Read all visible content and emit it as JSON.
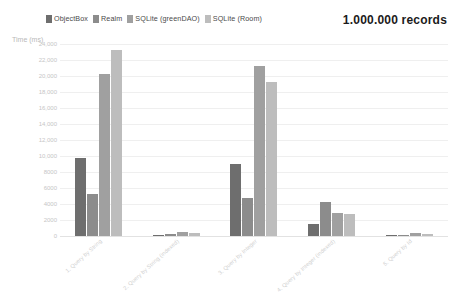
{
  "title": "1.000.000 records",
  "axis_title": "Time (ms)",
  "legend": [
    {
      "label": "ObjectBox",
      "color": "#6e6e6e"
    },
    {
      "label": "Realm",
      "color": "#8c8c8c"
    },
    {
      "label": "SQLite (greenDAO)",
      "color": "#a0a0a0"
    },
    {
      "label": "SQLite (Room)",
      "color": "#bdbdbd"
    }
  ],
  "chart_data": {
    "type": "bar",
    "title": "1.000.000 records",
    "xlabel": "",
    "ylabel": "Time (ms)",
    "ylim": [
      0,
      24000
    ],
    "ytick_values": [
      24000,
      22000,
      20000,
      18000,
      16000,
      14000,
      12000,
      10000,
      8000,
      6000,
      4000,
      2000,
      0
    ],
    "ytick_labels": [
      "24,000",
      "22,000",
      "20,000",
      "18,000",
      "16,000",
      "14,000",
      "12,000",
      "10,000",
      "8000",
      "6000",
      "4000",
      "2000",
      "0"
    ],
    "grid": true,
    "legend_position": "top-left",
    "categories": [
      "1. Query by String",
      "2. Query by String (indexed)",
      "3. Query by Integer",
      "4. Query by Integer (indexed)",
      "5. Query by Id"
    ],
    "series": [
      {
        "name": "ObjectBox",
        "color": "#6e6e6e",
        "values": [
          9800,
          120,
          9000,
          1500,
          60
        ]
      },
      {
        "name": "Realm",
        "color": "#8c8c8c",
        "values": [
          5300,
          200,
          4800,
          4200,
          120
        ]
      },
      {
        "name": "SQLite (greenDAO)",
        "color": "#a0a0a0",
        "values": [
          20200,
          480,
          21300,
          2900,
          330
        ]
      },
      {
        "name": "SQLite (Room)",
        "color": "#bdbdbd",
        "values": [
          23300,
          380,
          19300,
          2800,
          260
        ]
      }
    ]
  }
}
